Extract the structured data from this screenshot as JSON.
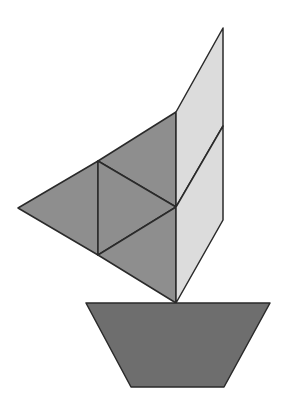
{
  "figure": {
    "colors": {
      "background": "#ffffff",
      "sail_dark": "#8e8e8e",
      "sail_light": "#dcdcdc",
      "hull": "#6e6e6e",
      "stroke": "#2a2a2a"
    },
    "shapes": {
      "left_triangle": "18,208 98,161 98,255",
      "upper_triangle": "98,161 176,112 176,207",
      "middle_triangle": "98,161 176,207 98,255",
      "lower_triangle": "98,255 176,207 176,303",
      "light_upper_parallelogram": "176,112 223,28 223,126 176,207",
      "light_lower_parallelogram": "176,207 223,126 223,220 176,303",
      "hull_trapezoid": "86,303 270,303 224,387 131,387"
    }
  }
}
